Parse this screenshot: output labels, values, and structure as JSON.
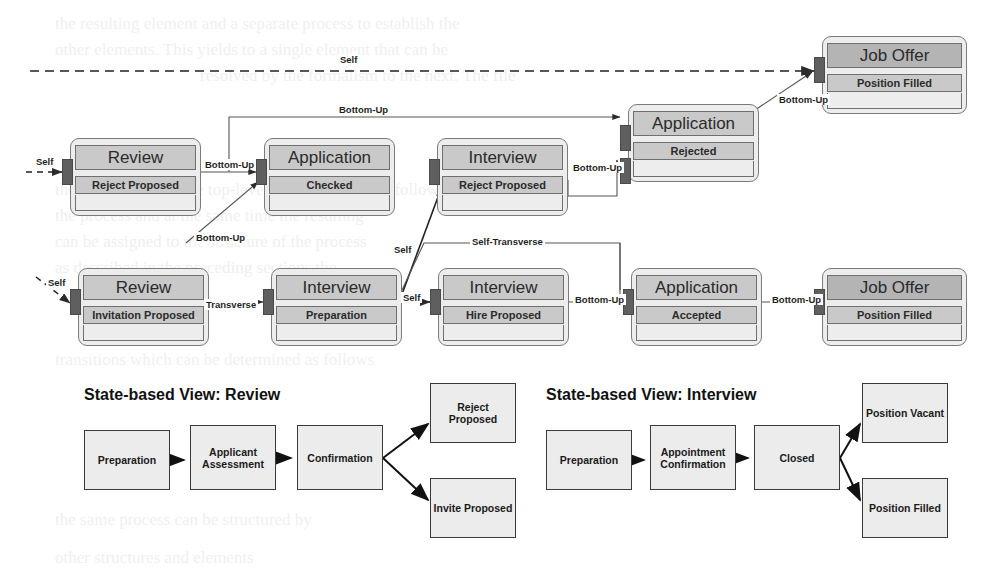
{
  "canvas": {
    "width": 985,
    "height": 572,
    "background": "#ffffff"
  },
  "palette": {
    "node_fill": "#ededed",
    "band_fill": "#c9c9c9",
    "band_fill_dark": "#b4b4b4",
    "node_border": "#7b7b7b",
    "port_fill": "#5f5f5f",
    "edge_stroke": "#555555",
    "state_box_fill": "#ececec",
    "state_box_border": "#3a3a3a",
    "text": "#222222"
  },
  "top_diagram": {
    "nodes": [
      {
        "id": "review-reject",
        "title": "Review",
        "sub": "Reject Proposed",
        "x": 70,
        "y": 138,
        "w": 131,
        "h": 78,
        "dark": false
      },
      {
        "id": "application-checked",
        "title": "Application",
        "sub": "Checked",
        "x": 264,
        "y": 138,
        "w": 131,
        "h": 78,
        "dark": false
      },
      {
        "id": "interview-reject",
        "title": "Interview",
        "sub": "Reject Proposed",
        "x": 437,
        "y": 138,
        "w": 131,
        "h": 78,
        "dark": false
      },
      {
        "id": "application-rejected",
        "title": "Application",
        "sub": "Rejected",
        "x": 628,
        "y": 104,
        "w": 131,
        "h": 78,
        "dark": false
      },
      {
        "id": "joboffer-top",
        "title": "Job Offer",
        "sub": "Position Filled",
        "x": 822,
        "y": 36,
        "w": 145,
        "h": 78,
        "dark": true
      },
      {
        "id": "review-invitation",
        "title": "Review",
        "sub": "Invitation Proposed",
        "x": 78,
        "y": 268,
        "w": 131,
        "h": 78,
        "dark": false
      },
      {
        "id": "interview-prep",
        "title": "Interview",
        "sub": "Preparation",
        "x": 271,
        "y": 268,
        "w": 131,
        "h": 78,
        "dark": false
      },
      {
        "id": "interview-hire",
        "title": "Interview",
        "sub": "Hire Proposed",
        "x": 438,
        "y": 268,
        "w": 131,
        "h": 78,
        "dark": false
      },
      {
        "id": "application-accepted",
        "title": "Application",
        "sub": "Accepted",
        "x": 631,
        "y": 268,
        "w": 131,
        "h": 78,
        "dark": false
      },
      {
        "id": "joboffer-bottom",
        "title": "Job Offer",
        "sub": "Position Filled",
        "x": 822,
        "y": 268,
        "w": 145,
        "h": 78,
        "dark": true
      }
    ],
    "edge_labels": [
      {
        "id": "self-top",
        "text": "Self",
        "x": 338,
        "y": 54
      },
      {
        "id": "self-into-review-1",
        "text": "Self",
        "x": 34,
        "y": 156
      },
      {
        "id": "self-into-review-2",
        "text": "Self",
        "x": 46,
        "y": 277
      },
      {
        "id": "bottomup-top-long",
        "text": "Bottom-Up",
        "x": 337,
        "y": 104
      },
      {
        "id": "bottomup-review-app",
        "text": "Bottom-Up",
        "x": 203,
        "y": 159
      },
      {
        "id": "bottomup-left-diag",
        "text": "Bottom-Up",
        "x": 194,
        "y": 232
      },
      {
        "id": "bottomup-to-rejected",
        "text": "Bottom-Up",
        "x": 571,
        "y": 162
      },
      {
        "id": "bottomup-to-joboffer",
        "text": "Bottom-Up",
        "x": 777,
        "y": 94
      },
      {
        "id": "transverse",
        "text": "Transverse",
        "x": 204,
        "y": 299
      },
      {
        "id": "self-diag-upper",
        "text": "Self",
        "x": 392,
        "y": 244
      },
      {
        "id": "self-diag-lower",
        "text": "Self",
        "x": 401,
        "y": 292
      },
      {
        "id": "self-transverse",
        "text": "Self-Transverse",
        "x": 470,
        "y": 236
      },
      {
        "id": "bottomup-hire-app",
        "text": "Bottom-Up",
        "x": 573,
        "y": 294
      },
      {
        "id": "bottomup-app-joboffer",
        "text": "Bottom-Up",
        "x": 770,
        "y": 294
      }
    ]
  },
  "state_views": [
    {
      "id": "state-view-review",
      "title": "State-based View: Review",
      "title_x": 84,
      "title_y": 386,
      "boxes": [
        {
          "id": "review-preparation",
          "label": "Preparation",
          "x": 84,
          "y": 430,
          "w": 86,
          "h": 60
        },
        {
          "id": "review-assessment",
          "label": "Applicant Assessment",
          "x": 190,
          "y": 425,
          "w": 86,
          "h": 65
        },
        {
          "id": "review-confirmation",
          "label": "Confirmation",
          "x": 297,
          "y": 425,
          "w": 86,
          "h": 65
        },
        {
          "id": "review-reject-prop",
          "label": "Reject Proposed",
          "x": 430,
          "y": 383,
          "w": 86,
          "h": 60
        },
        {
          "id": "review-invite-prop",
          "label": "Invite Proposed",
          "x": 430,
          "y": 478,
          "w": 86,
          "h": 60
        }
      ]
    },
    {
      "id": "state-view-interview",
      "title": "State-based View: Interview",
      "title_x": 546,
      "title_y": 386,
      "boxes": [
        {
          "id": "interview-preparation",
          "label": "Preparation",
          "x": 546,
          "y": 430,
          "w": 86,
          "h": 60
        },
        {
          "id": "interview-appointment",
          "label": "Appointment Confirmation",
          "x": 650,
          "y": 425,
          "w": 86,
          "h": 65
        },
        {
          "id": "interview-closed",
          "label": "Closed",
          "x": 754,
          "y": 425,
          "w": 86,
          "h": 65
        },
        {
          "id": "interview-pos-vacant",
          "label": "Position Vacant",
          "x": 862,
          "y": 383,
          "w": 86,
          "h": 60
        },
        {
          "id": "interview-pos-filled",
          "label": "Position Filled",
          "x": 862,
          "y": 478,
          "w": 86,
          "h": 60
        }
      ]
    }
  ],
  "background_text": [
    {
      "text": "the resulting element and a separate process to establish the",
      "x": 55,
      "y": 14
    },
    {
      "text": "other elements. This yields to a single element that can be",
      "x": 55,
      "y": 40
    },
    {
      "text": "resolved by the formalism to the next. The file",
      "x": 200,
      "y": 66
    },
    {
      "text": "their transitions to the top-level can be derived as follows",
      "x": 55,
      "y": 180
    },
    {
      "text": "the process and at the same time the resulting",
      "x": 55,
      "y": 206
    },
    {
      "text": "can be assigned to the structure of the process",
      "x": 55,
      "y": 232
    },
    {
      "text": "as described in the preceding sections the",
      "x": 55,
      "y": 258
    },
    {
      "text": "transitions which can be determined as follows",
      "x": 55,
      "y": 350
    },
    {
      "text": "the same process can be structured by",
      "x": 55,
      "y": 510
    },
    {
      "text": "other structures and elements",
      "x": 55,
      "y": 548
    }
  ]
}
